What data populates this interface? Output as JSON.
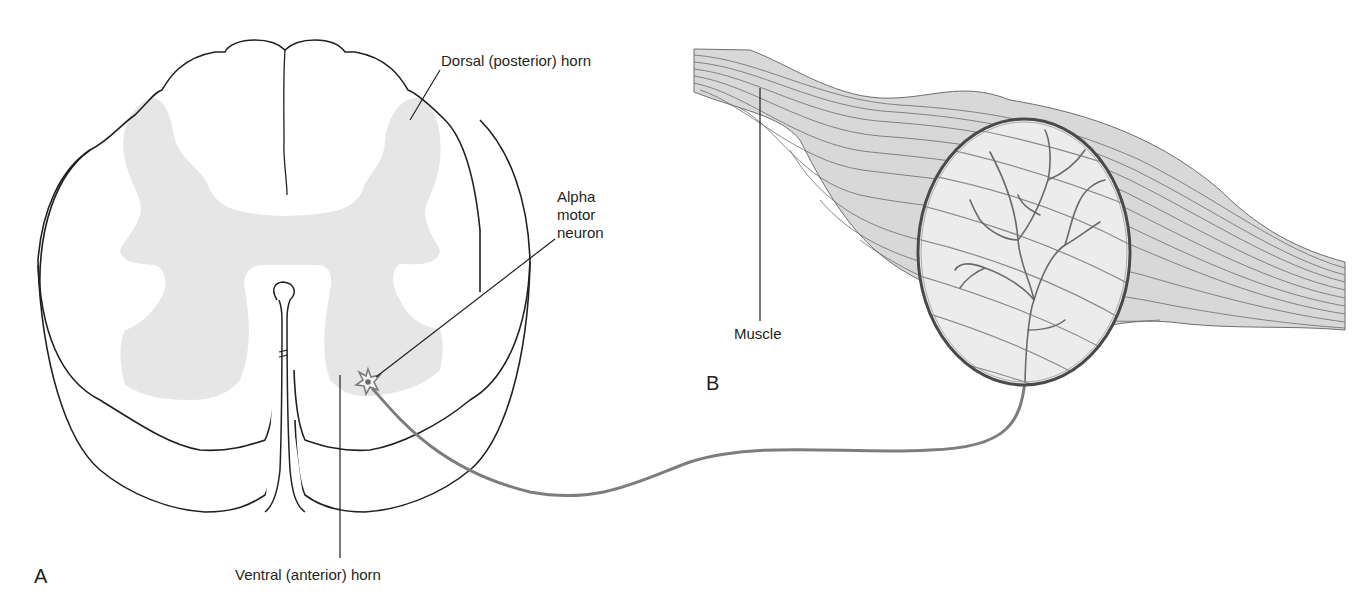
{
  "figure": {
    "panels": {
      "a": {
        "letter": "A"
      },
      "b": {
        "letter": "B"
      }
    },
    "labels": {
      "dorsal_horn": "Dorsal (posterior) horn",
      "ventral_horn": "Ventral (anterior) horn",
      "alpha_motor_neuron": [
        "Alpha",
        "motor",
        "neuron"
      ],
      "muscle": "Muscle"
    },
    "colors": {
      "outline": "#231f20",
      "gray_matter": "#e6e6e6",
      "axon": "#7d7d7d",
      "muscle_fiber": "#6e6e6e",
      "inset_fill": "#ececec",
      "inset_ring": "#4a4a4a"
    }
  }
}
